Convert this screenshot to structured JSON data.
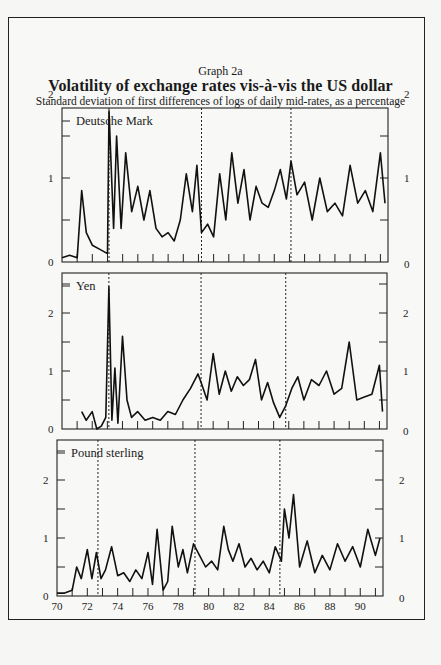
{
  "header": {
    "graph_label": "Graph 2a",
    "title": "Volatility of exchange rates vis-à-vis the US dollar",
    "subtitle": "Standard deviation of first differences of logs of daily mid-rates, as a percentage"
  },
  "chart_data": [
    {
      "type": "line",
      "title": "Deutsche Mark",
      "ylabel": "Standard deviation (%)",
      "xlabel": "",
      "ylim": [
        0,
        2.5
      ],
      "yticks": [
        0,
        1,
        2
      ],
      "xlim": [
        1970,
        1991.5
      ],
      "reference_lines_x": [
        1973.1,
        1979.2,
        1985.1
      ],
      "x": [
        1970,
        1970.5,
        1971,
        1971.3,
        1971.6,
        1972,
        1972.5,
        1973,
        1973.1,
        1973.4,
        1973.6,
        1973.9,
        1974.2,
        1974.6,
        1975,
        1975.4,
        1975.8,
        1976.2,
        1976.6,
        1977,
        1977.4,
        1977.8,
        1978.2,
        1978.6,
        1978.9,
        1979.2,
        1979.6,
        1980,
        1980.4,
        1980.8,
        1981.2,
        1981.6,
        1982,
        1982.4,
        1982.8,
        1983.2,
        1983.6,
        1984,
        1984.4,
        1984.8,
        1985.1,
        1985.5,
        1986,
        1986.5,
        1987,
        1987.5,
        1988,
        1988.5,
        1989,
        1989.5,
        1990,
        1990.5,
        1991,
        1991.3
      ],
      "values": [
        0.05,
        0.08,
        0.05,
        0.85,
        0.35,
        0.2,
        0.15,
        0.1,
        1.8,
        0.4,
        1.5,
        0.4,
        1.3,
        0.6,
        0.9,
        0.5,
        0.85,
        0.4,
        0.3,
        0.35,
        0.25,
        0.5,
        1.05,
        0.6,
        1.15,
        0.35,
        0.45,
        0.3,
        1.05,
        0.5,
        1.3,
        0.7,
        1.1,
        0.5,
        0.9,
        0.7,
        0.65,
        0.85,
        1.1,
        0.75,
        1.2,
        0.8,
        0.95,
        0.5,
        1.0,
        0.6,
        0.7,
        0.55,
        1.15,
        0.7,
        0.85,
        0.6,
        1.3,
        0.7
      ]
    },
    {
      "type": "line",
      "title": "Yen",
      "ylabel": "Standard deviation (%)",
      "xlabel": "",
      "ylim": [
        0,
        2.5
      ],
      "yticks": [
        0,
        1,
        2
      ],
      "xlim": [
        1970,
        1991.5
      ],
      "reference_lines_x": [
        1973.1,
        1979.2,
        1984.8
      ],
      "x": [
        1971.3,
        1971.6,
        1972,
        1972.3,
        1972.6,
        1972.9,
        1973.1,
        1973.3,
        1973.5,
        1973.7,
        1974,
        1974.3,
        1974.6,
        1975,
        1975.5,
        1976,
        1976.5,
        1977,
        1977.5,
        1978,
        1978.5,
        1979,
        1979.2,
        1979.6,
        1980,
        1980.4,
        1980.8,
        1981.2,
        1981.6,
        1982,
        1982.4,
        1982.8,
        1983.2,
        1983.6,
        1984,
        1984.4,
        1984.8,
        1985.2,
        1985.6,
        1986,
        1986.5,
        1987,
        1987.5,
        1988,
        1988.5,
        1989,
        1989.5,
        1990,
        1990.5,
        1991,
        1991.2
      ],
      "values": [
        0.3,
        0.15,
        0.3,
        0.0,
        0.05,
        0.2,
        2.45,
        0.15,
        1.05,
        0.1,
        1.6,
        0.5,
        0.2,
        0.3,
        0.15,
        0.2,
        0.15,
        0.3,
        0.25,
        0.5,
        0.7,
        0.95,
        0.8,
        0.5,
        1.3,
        0.6,
        1.0,
        0.65,
        0.9,
        0.75,
        0.85,
        1.2,
        0.5,
        0.8,
        0.45,
        0.2,
        0.4,
        0.7,
        0.9,
        0.5,
        0.85,
        0.75,
        1.0,
        0.6,
        0.7,
        1.5,
        0.5,
        0.55,
        0.6,
        1.1,
        0.3
      ]
    },
    {
      "type": "line",
      "title": "Pound sterling",
      "ylabel": "Standard deviation (%)",
      "xlabel": "",
      "ylim": [
        0,
        2.5
      ],
      "yticks": [
        0,
        1,
        2
      ],
      "xlim": [
        1970,
        1991.5
      ],
      "x_tick_labels": [
        "70",
        "72",
        "74",
        "76",
        "78",
        "80",
        "82",
        "84",
        "86",
        "88",
        "90"
      ],
      "reference_lines_x": [
        1972.7,
        1979.1,
        1984.7
      ],
      "x": [
        1970,
        1970.5,
        1971,
        1971.3,
        1971.6,
        1972,
        1972.3,
        1972.6,
        1972.9,
        1973.2,
        1973.6,
        1974,
        1974.4,
        1974.8,
        1975.2,
        1975.6,
        1976,
        1976.3,
        1976.6,
        1977,
        1977.3,
        1977.6,
        1978,
        1978.3,
        1978.6,
        1979,
        1979.4,
        1979.8,
        1980.2,
        1980.6,
        1981,
        1981.3,
        1981.6,
        1982,
        1982.4,
        1982.8,
        1983.2,
        1983.6,
        1984,
        1984.4,
        1984.8,
        1985,
        1985.3,
        1985.6,
        1986,
        1986.5,
        1987,
        1987.5,
        1988,
        1988.5,
        1989,
        1989.5,
        1990,
        1990.5,
        1991,
        1991.3
      ],
      "values": [
        0.05,
        0.05,
        0.1,
        0.5,
        0.3,
        0.8,
        0.3,
        0.75,
        0.3,
        0.45,
        0.85,
        0.35,
        0.4,
        0.25,
        0.45,
        0.3,
        0.75,
        0.2,
        1.15,
        0.1,
        0.25,
        1.2,
        0.5,
        0.8,
        0.4,
        0.9,
        0.7,
        0.5,
        0.6,
        0.45,
        1.2,
        0.8,
        0.6,
        0.9,
        0.5,
        0.65,
        0.45,
        0.6,
        0.4,
        0.85,
        0.6,
        1.5,
        1.0,
        1.75,
        0.5,
        0.95,
        0.4,
        0.7,
        0.45,
        0.9,
        0.6,
        0.85,
        0.5,
        1.15,
        0.7,
        1.0
      ]
    }
  ]
}
